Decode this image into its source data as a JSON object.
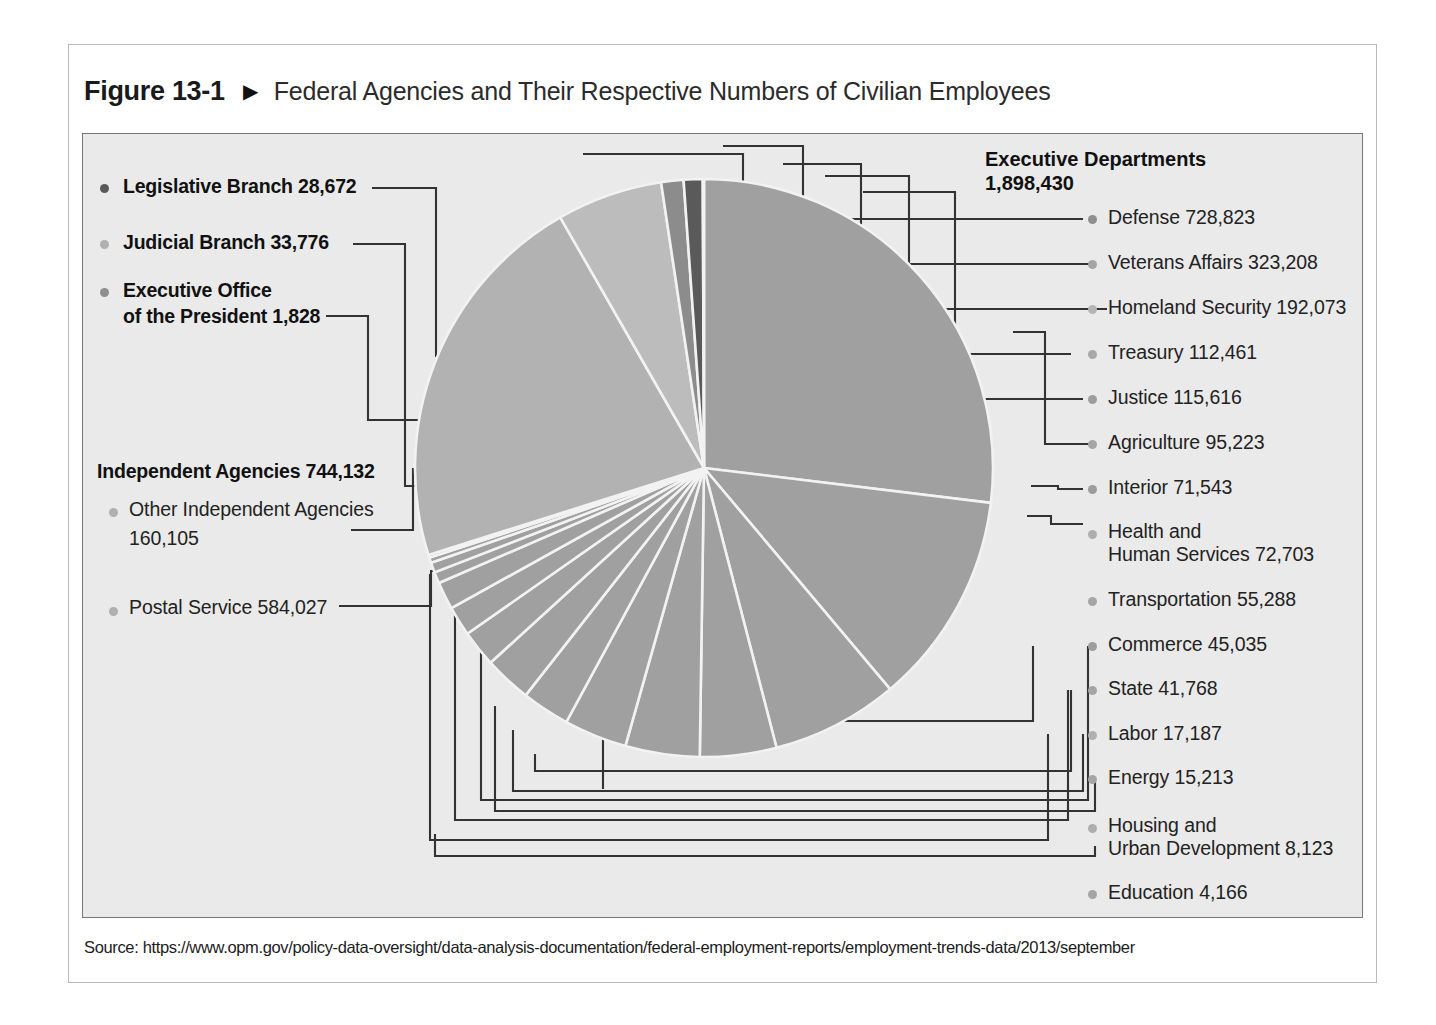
{
  "figure": {
    "number": "Figure 13-1",
    "marker": "▶",
    "title": "Federal Agencies and Their Respective Numbers of Civilian Employees"
  },
  "source": {
    "label": "Source: https://www.opm.gov/policy-data-oversight/data-analysis-documentation/federal-employment-reports/employment-trends-data/2013/september"
  },
  "left_labels": {
    "legislative": "Legislative Branch 28,672",
    "judicial": "Judicial Branch 33,776",
    "executive_office_l1": "Executive Office",
    "executive_office_l2": "of the President 1,828",
    "independent_header": "Independent Agencies 744,132",
    "other_independent_l1": "Other Independent Agencies",
    "other_independent_l2": "160,105",
    "postal": "Postal Service 584,027"
  },
  "right_header": {
    "line1": "Executive Departments",
    "line2": "1,898,430"
  },
  "right_labels": [
    "Defense  728,823",
    "Veterans Affairs  323,208",
    "Homeland Security  192,073",
    "Treasury 112,461",
    "Justice  115,616",
    "Agriculture  95,223",
    "Interior  71,543",
    "Transportation  55,288",
    "Commerce  45,035",
    "State  41,768",
    "Labor  17,187",
    "Energy  15,213",
    "Education  4,166"
  ],
  "right_labels_wrapped": {
    "hhs_l1": "Health and",
    "hhs_l2": "Human Services  72,703",
    "hud_l1": "Housing and",
    "hud_l2": "Urban Development  8,123"
  },
  "colors": {
    "page_background": "#ffffff",
    "panel_background": "#eaeaea",
    "panel_border": "#777777",
    "figure_border": "#b9b9b9",
    "pie_main": "#a0a0a0",
    "pie_dark": "#5a5a5a",
    "pie_mid": "#8c8c8c",
    "pie_light": "#bcbcbc",
    "pie_divider": "#f2f2f2",
    "leader_line": "#333333",
    "bullet_dark": "#6e6e6e",
    "bullet_mid": "#8f8f8f",
    "bullet_light": "#b0b0b0",
    "title_text": "#1a1a1a"
  },
  "chart_data": {
    "type": "pie",
    "title": "Federal Agencies and Their Respective Numbers of Civilian Employees",
    "unit": "civilian employees",
    "total": 2706838,
    "legend_position": "both-sides-with-leader-lines",
    "groups": [
      {
        "name": "Executive Departments",
        "total": 1898430,
        "side": "right"
      },
      {
        "name": "Independent Agencies",
        "total": 744132,
        "side": "left"
      },
      {
        "name": "Legislative Branch",
        "total": 28672,
        "side": "left"
      },
      {
        "name": "Judicial Branch",
        "total": 33776,
        "side": "left"
      },
      {
        "name": "Executive Office of the President",
        "total": 1828,
        "side": "left"
      }
    ],
    "labels": [
      "Defense",
      "Veterans Affairs",
      "Homeland Security",
      "Justice",
      "Treasury",
      "Agriculture",
      "Health and Human Services",
      "Interior",
      "Transportation",
      "Commerce",
      "State",
      "Labor",
      "Energy",
      "Housing and Urban Development",
      "Education",
      "Postal Service",
      "Other Independent Agencies",
      "Judicial Branch",
      "Legislative Branch",
      "Executive Office of the President"
    ],
    "values": [
      728823,
      323208,
      192073,
      115616,
      112461,
      95223,
      72703,
      71543,
      55288,
      45035,
      41768,
      17187,
      15213,
      8123,
      4166,
      584027,
      160105,
      33776,
      28672,
      1828
    ],
    "slice_shades": [
      "#a0a0a0",
      "#a0a0a0",
      "#a0a0a0",
      "#a0a0a0",
      "#a0a0a0",
      "#a0a0a0",
      "#a0a0a0",
      "#a0a0a0",
      "#a0a0a0",
      "#a0a0a0",
      "#a0a0a0",
      "#a0a0a0",
      "#a0a0a0",
      "#a0a0a0",
      "#a0a0a0",
      "#b2b2b2",
      "#bcbcbc",
      "#8c8c8c",
      "#5a5a5a",
      "#8c8c8c"
    ]
  }
}
